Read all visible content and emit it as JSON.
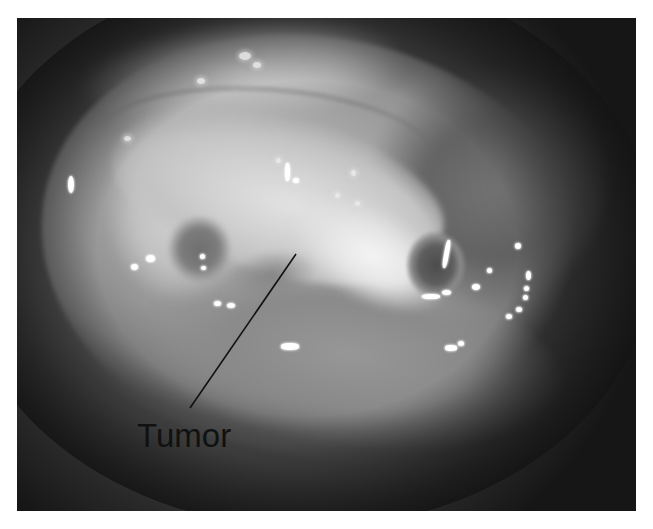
{
  "image": {
    "kind": "endoscopic photograph",
    "colormode": "grayscale"
  },
  "annotations": [
    {
      "label": "Tumor",
      "label_position": {
        "x": 137,
        "y": 447
      },
      "leader_line": {
        "x1": 296,
        "y1": 254,
        "x2": 190,
        "y2": 408
      },
      "color": "#111111"
    }
  ]
}
